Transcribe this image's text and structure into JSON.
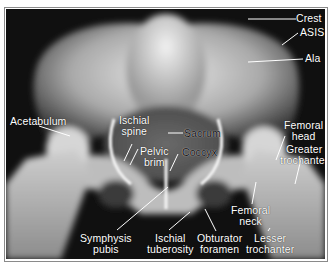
{
  "figure": {
    "labels": {
      "crest": "Crest",
      "asis": "ASIS",
      "ala": "Ala",
      "acetabulum": "Acetabulum",
      "ischial_spine": [
        "Ischial",
        "spine"
      ],
      "sacrum": "Sacrum",
      "pelvic_brim": [
        "Pelvic",
        "brim"
      ],
      "coccyx": "Coccyx",
      "femoral_head": [
        "Femoral",
        "head"
      ],
      "greater_trochanter": [
        "Greater",
        "trochanter"
      ],
      "femoral_neck": [
        "Femoral",
        "neck"
      ],
      "symphysis_pubis": [
        "Symphysis",
        "pubis"
      ],
      "ischial_tuberosity": [
        "Ischial",
        "tuberosity"
      ],
      "obturator_foramen": [
        "Obturator",
        "foramen"
      ],
      "lesser_trochanter": [
        "Lesser",
        "trochanter"
      ]
    },
    "colors": {
      "background": "#0d0d0d",
      "bone": "#d8d8d8",
      "label": "#ffffff",
      "frame": "#8a8a8a"
    }
  }
}
